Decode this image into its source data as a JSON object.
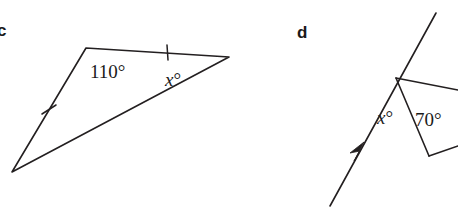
{
  "page": {
    "width": 458,
    "height": 211,
    "background": "#ffffff",
    "ink_color": "#231f20"
  },
  "figures": [
    {
      "id": "c",
      "label": "c",
      "type": "triangle",
      "description": "Scalene triangle with two equal sides marked by single tick marks; interior angle 110 degrees at the top-left vertex and unknown angle x degrees at the right vertex.",
      "labels": {
        "angle_known": "110°",
        "angle_unknown_var": "x",
        "angle_unknown_deg": "°"
      }
    },
    {
      "id": "d",
      "label": "d",
      "type": "transversal-with-triangle",
      "description": "A straight line with an arrowhead pointing up-right crosses a vertex where two further rays form a narrow triangle; angle x degrees sits left of the vertex and angle 70 degrees sits inside the triangle.",
      "labels": {
        "angle_known": "70°",
        "angle_unknown_var": "x",
        "angle_unknown_deg": "°"
      }
    }
  ],
  "geometry": {
    "c": {
      "vertices": {
        "top_left": [
          86,
          48
        ],
        "right": [
          229,
          57
        ],
        "bottom_left": [
          12,
          172
        ]
      },
      "ticks": [
        {
          "on": "top_edge",
          "at": [
            167,
            52
          ]
        },
        {
          "on": "left_edge",
          "at": [
            49,
            110
          ]
        }
      ]
    },
    "d": {
      "line_start": [
        330,
        206
      ],
      "line_end": [
        436,
        13
      ],
      "arrow_at": [
        361,
        149
      ],
      "vertex": [
        396,
        78
      ],
      "ray_right_end": [
        458,
        90
      ],
      "tri_bottom": [
        429,
        156
      ],
      "tri_bottom_right_end": [
        458,
        146
      ]
    }
  }
}
